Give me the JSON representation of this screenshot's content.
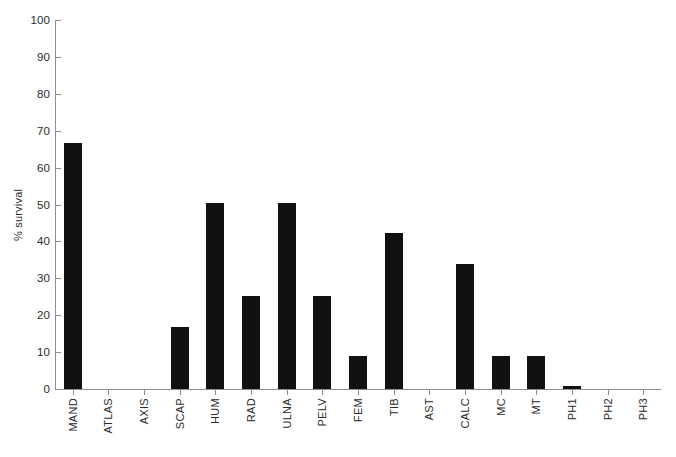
{
  "chart_data": {
    "type": "bar",
    "title": "",
    "xlabel": "",
    "ylabel": "% survival",
    "ylim": [
      0,
      100
    ],
    "yticks": [
      0,
      10,
      20,
      30,
      40,
      50,
      60,
      70,
      80,
      90,
      100
    ],
    "grid": false,
    "legend": null,
    "bar_color": "#111111",
    "axis_color": "#8e8e8e",
    "categories": [
      "MAND",
      "ATLAS",
      "AXIS",
      "SCAP",
      "HUM",
      "RAD",
      "ULNA",
      "PELV",
      "FEM",
      "TIB",
      "AST",
      "CALC",
      "MC",
      "MT",
      "PH1",
      "PH2",
      "PH3"
    ],
    "values": [
      66.7,
      0,
      0,
      16.7,
      50.3,
      25.1,
      50.3,
      25.1,
      9.0,
      42.2,
      0,
      34.0,
      9.0,
      9.0,
      0.8,
      0,
      0
    ],
    "series": [
      {
        "name": "% survival",
        "values": [
          66.7,
          0,
          0,
          16.7,
          50.3,
          25.1,
          50.3,
          25.1,
          9.0,
          42.2,
          0,
          34.0,
          9.0,
          9.0,
          0.8,
          0,
          0
        ]
      }
    ]
  }
}
